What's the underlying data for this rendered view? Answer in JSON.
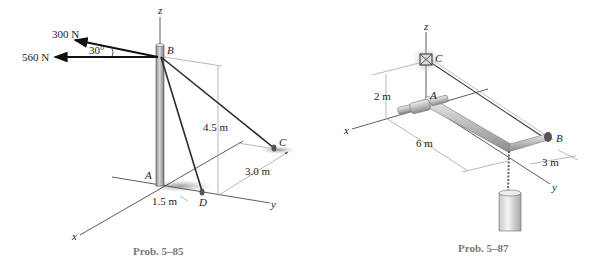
{
  "figure_left": {
    "caption": "Prob. 5–85",
    "forces": [
      {
        "label": "300 N",
        "direction": "30° above horizontal"
      },
      {
        "label": "560 N",
        "direction": "horizontal"
      }
    ],
    "angle_label": "30°",
    "points": {
      "A": "A",
      "B": "B",
      "C": "C",
      "D": "D"
    },
    "axes": {
      "x": "x",
      "y": "y",
      "z": "z"
    },
    "dimensions": {
      "height": "4.5 m",
      "ac_offset": "3.0 m",
      "ad_offset": "1.5 m"
    }
  },
  "figure_right": {
    "caption": "Prob. 5–87",
    "points": {
      "A": "A",
      "B": "B",
      "C": "C"
    },
    "axes": {
      "x": "x",
      "y": "y",
      "z": "z"
    },
    "dimensions": {
      "height": "2 m",
      "length": "6 m",
      "width": "3 m"
    }
  }
}
